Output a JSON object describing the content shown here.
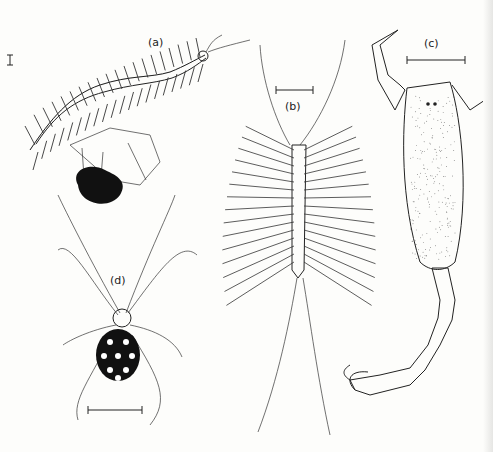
{
  "figure": {
    "panels": [
      {
        "id": "a",
        "label": "(a)",
        "subject": "centipede"
      },
      {
        "id": "b",
        "label": "(b)",
        "subject": "house centipede"
      },
      {
        "id": "c",
        "label": "(c)",
        "subject": "scorpion"
      },
      {
        "id": "d",
        "label": "(d)",
        "subject": "widow spider"
      }
    ],
    "extra": {
      "subject": "spider on web (ventral silhouette)"
    },
    "scale_bars": [
      "a",
      "b",
      "c",
      "d"
    ],
    "colors": {
      "ink": "#222222",
      "paper": "#fdfdfb"
    }
  }
}
